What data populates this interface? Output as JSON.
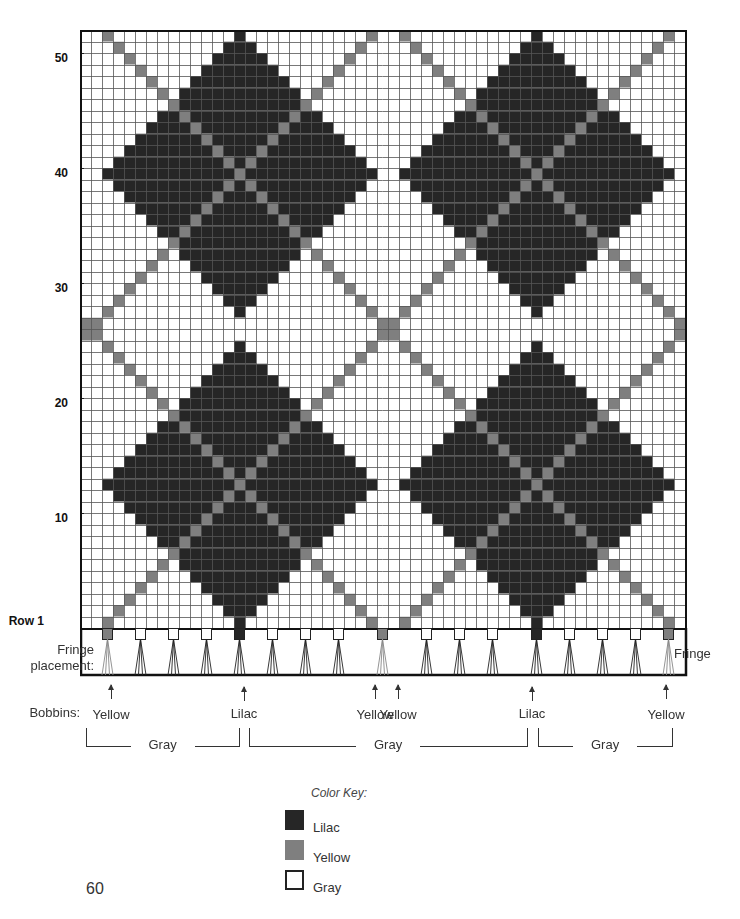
{
  "chart": {
    "columns": 55,
    "rows": 52,
    "cell_width": 11,
    "cell_height": 11.5,
    "colors": {
      "lilac": "#262626",
      "yellow": "#7f7f7f",
      "gray": "#ffffff",
      "grid_line": "#555555",
      "frame": "#111111"
    },
    "pattern": {
      "lilac_diamond_centers": [
        {
          "col": 14,
          "row": 13
        },
        {
          "col": 41,
          "row": 13
        },
        {
          "col": 14,
          "row": 40
        },
        {
          "col": 41,
          "row": 40
        }
      ],
      "lilac_diamond_radius": 12,
      "yellow_diagonals": "(col - row - 1) mod 27 == 0 OR (col + row) mod 27 == 0"
    }
  },
  "row_labels": [
    {
      "text": "50",
      "row": 50
    },
    {
      "text": "40",
      "row": 40
    },
    {
      "text": "30",
      "row": 30
    },
    {
      "text": "20",
      "row": 20
    },
    {
      "text": "10",
      "row": 10
    },
    {
      "text": "Row 1",
      "row": 1
    }
  ],
  "fringe": {
    "label_line1": "Fringe",
    "label_line2": "placement:",
    "right_label": "Fringe",
    "positions": [
      {
        "col": 2,
        "color": "yellow"
      },
      {
        "col": 5,
        "color": "gray"
      },
      {
        "col": 8,
        "color": "gray"
      },
      {
        "col": 11,
        "color": "gray"
      },
      {
        "col": 14,
        "color": "lilac"
      },
      {
        "col": 17,
        "color": "gray"
      },
      {
        "col": 20,
        "color": "gray"
      },
      {
        "col": 23,
        "color": "gray"
      },
      {
        "col": 27,
        "color": "yellow"
      },
      {
        "col": 31,
        "color": "gray"
      },
      {
        "col": 34,
        "color": "gray"
      },
      {
        "col": 37,
        "color": "gray"
      },
      {
        "col": 41,
        "color": "lilac"
      },
      {
        "col": 44,
        "color": "gray"
      },
      {
        "col": 47,
        "color": "gray"
      },
      {
        "col": 50,
        "color": "gray"
      },
      {
        "col": 53,
        "color": "yellow"
      }
    ]
  },
  "bobbins": {
    "label": "Bobbins:",
    "items": [
      {
        "text": "Yellow",
        "x": 111
      },
      {
        "text": "Lilac",
        "x": 244
      },
      {
        "text": "Yellow",
        "x": 375
      },
      {
        "text": "Yellow",
        "x": 398
      },
      {
        "text": "Lilac",
        "x": 532
      },
      {
        "text": "Yellow",
        "x": 666
      }
    ],
    "gray_sections": [
      {
        "text": "Gray",
        "x1": 86,
        "x2": 239
      },
      {
        "text": "Gray",
        "x1": 249,
        "x2": 527
      },
      {
        "text": "Gray",
        "x1": 538,
        "x2": 672
      }
    ]
  },
  "color_key": {
    "title": "Color Key:",
    "items": [
      {
        "label": "Lilac",
        "color": "lilac"
      },
      {
        "label": "Yellow",
        "color": "yellow"
      },
      {
        "label": "Gray",
        "color": "gray"
      }
    ]
  },
  "page_number": "60"
}
